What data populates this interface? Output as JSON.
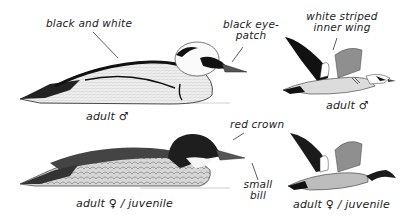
{
  "figure": {
    "colors": {
      "ink": "#111111",
      "grey": "#9a9a9a",
      "light_grey": "#d8d8d8",
      "background": "#ffffff"
    }
  },
  "annotations": {
    "black_and_white": "black and white",
    "black_eye_patch_line1": "black eye-",
    "black_eye_patch_line2": "patch",
    "white_striped_line1": "white striped",
    "white_striped_line2": "inner wing",
    "red_crown": "red crown",
    "small_bill_line1": "small",
    "small_bill_line2": "bill"
  },
  "captions": {
    "male_swimming": "adult ♂",
    "male_flying": "adult ♂",
    "female_swimming": "adult ♀ / juvenile",
    "female_flying": "adult ♀ / juvenile"
  }
}
